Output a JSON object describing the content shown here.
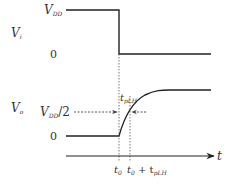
{
  "diagram": {
    "input_signal": {
      "label": "V",
      "label_sub": "i",
      "high_label": "V",
      "high_label_sub": "DD",
      "low_label": "0"
    },
    "output_signal": {
      "label": "V",
      "label_sub": "o",
      "mid_label": "V",
      "mid_label_sub": "DD",
      "mid_label_suffix": "/2",
      "low_label": "0"
    },
    "delay_label": "t",
    "delay_label_sub": "pLH",
    "time_axis": {
      "label": "t",
      "t0_label": "t",
      "t0_sub": "0",
      "t1_label_a": "t",
      "t1_sub_a": "0",
      "t1_plus": " + t",
      "t1_sub_b": "pLH"
    },
    "colors": {
      "line": "#222222",
      "dashed": "#444444",
      "text": "#333333"
    }
  }
}
